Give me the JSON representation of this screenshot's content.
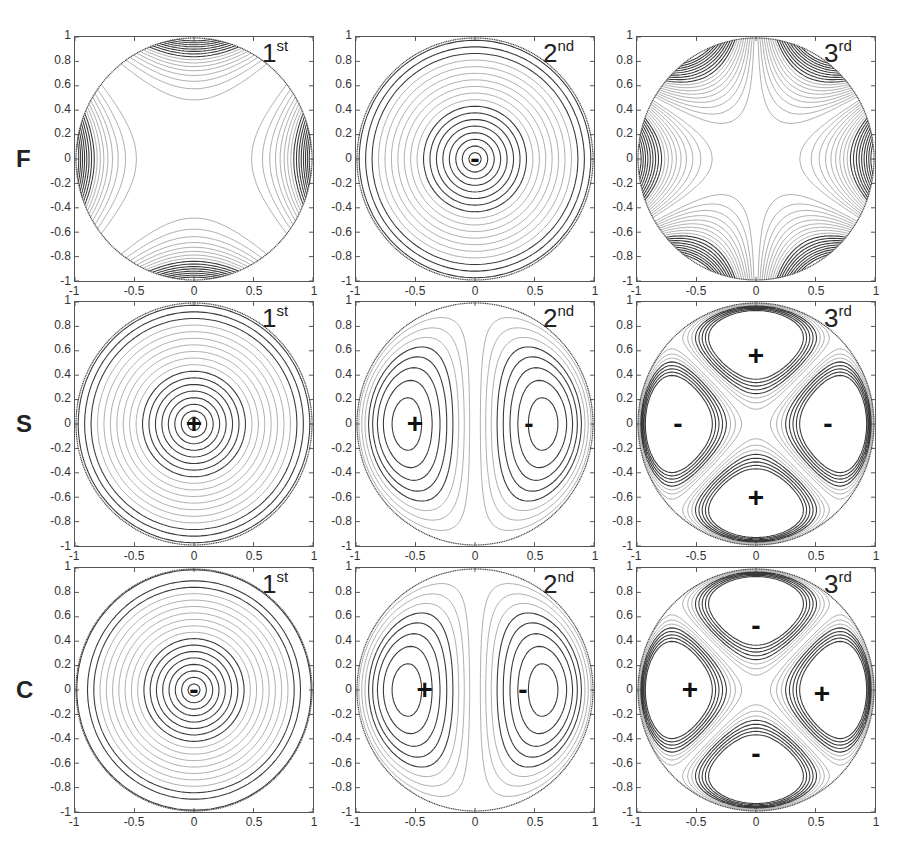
{
  "figure": {
    "rows": [
      {
        "label": "F"
      },
      {
        "label": "S"
      },
      {
        "label": "C"
      }
    ],
    "columns": [
      {
        "order": "1",
        "suffix": "st"
      },
      {
        "order": "2",
        "suffix": "nd"
      },
      {
        "order": "3",
        "suffix": "rd"
      }
    ],
    "axis_ticks": {
      "x": [
        "-1",
        "-0.5",
        "0",
        "0.5",
        "1"
      ],
      "y": [
        "1",
        "0.8",
        "0.6",
        "0.4",
        "0.2",
        "0",
        "-0.2",
        "-0.4",
        "-0.6",
        "-0.8",
        "-1"
      ]
    },
    "colors": {
      "dark_contour": "#3a3a3a",
      "light_contour": "#9a9a9a",
      "axes": "#555555"
    }
  },
  "chart_data": {
    "type": "contour",
    "title": "",
    "layout": "3x3 grid of contour plots on unit disk",
    "xlabel": "",
    "ylabel": "",
    "xlim": [
      -1,
      1
    ],
    "ylim": [
      -1,
      1
    ],
    "grid": false,
    "row_labels": [
      "F",
      "S",
      "C"
    ],
    "column_labels": [
      "1st",
      "2nd",
      "3rd"
    ],
    "panels": [
      {
        "row": "F",
        "col": "1st",
        "pattern": "saddle, hyperbolic contours, extrema at left/right (x=±1) and top/bottom (y=±1) boundaries",
        "signs": []
      },
      {
        "row": "F",
        "col": "2nd",
        "pattern": "concentric circles",
        "signs": [
          {
            "symbol": "-",
            "x": 0.0,
            "y": 0.0
          }
        ]
      },
      {
        "row": "F",
        "col": "3rd",
        "pattern": "six-fold boundary lobes, extrema at boundary",
        "signs": []
      },
      {
        "row": "S",
        "col": "1st",
        "pattern": "concentric circles",
        "signs": [
          {
            "symbol": "+",
            "x": 0.0,
            "y": 0.0
          }
        ]
      },
      {
        "row": "S",
        "col": "2nd",
        "pattern": "dipole, two lobes",
        "signs": [
          {
            "symbol": "+",
            "x": -0.5,
            "y": 0.0
          },
          {
            "symbol": "-",
            "x": 0.45,
            "y": 0.0
          }
        ]
      },
      {
        "row": "S",
        "col": "3rd",
        "pattern": "quadrupole, four lobes",
        "signs": [
          {
            "symbol": "+",
            "x": 0.0,
            "y": 0.55
          },
          {
            "symbol": "-",
            "x": -0.65,
            "y": 0.0
          },
          {
            "symbol": "-",
            "x": 0.6,
            "y": 0.0
          },
          {
            "symbol": "+",
            "x": 0.0,
            "y": -0.6
          }
        ]
      },
      {
        "row": "C",
        "col": "1st",
        "pattern": "concentric circles",
        "signs": [
          {
            "symbol": "-",
            "x": 0.0,
            "y": 0.0
          }
        ]
      },
      {
        "row": "C",
        "col": "2nd",
        "pattern": "dipole, two lobes",
        "signs": [
          {
            "symbol": "+",
            "x": -0.42,
            "y": 0.0
          },
          {
            "symbol": "-",
            "x": 0.4,
            "y": 0.0
          }
        ]
      },
      {
        "row": "C",
        "col": "3rd",
        "pattern": "quadrupole, four lobes",
        "signs": [
          {
            "symbol": "-",
            "x": 0.0,
            "y": 0.52
          },
          {
            "symbol": "+",
            "x": -0.55,
            "y": 0.0
          },
          {
            "symbol": "+",
            "x": 0.55,
            "y": -0.03
          },
          {
            "symbol": "-",
            "x": 0.0,
            "y": -0.52
          }
        ]
      }
    ]
  }
}
